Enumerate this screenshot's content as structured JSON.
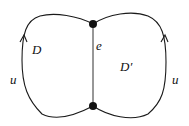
{
  "diagram": {
    "type": "graph-regions",
    "vertices": [
      {
        "id": "top",
        "x": 93,
        "y": 24
      },
      {
        "id": "bottom",
        "x": 93,
        "y": 106
      }
    ],
    "edges": [
      {
        "id": "e",
        "label": "e",
        "from": "top",
        "to": "bottom"
      },
      {
        "id": "left-boundary",
        "label": "u",
        "orientation": "upward arrow"
      },
      {
        "id": "right-boundary",
        "label": "u",
        "orientation": "upward arrow"
      }
    ],
    "labels": {
      "region_left": "D",
      "region_right": "D′",
      "edge_middle": "e",
      "left_path": "u",
      "right_path": "u"
    },
    "colors": {
      "stroke": "#1a1a1a",
      "vertex": "#111111",
      "background": "#ffffff"
    }
  }
}
